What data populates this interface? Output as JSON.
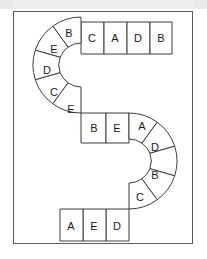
{
  "board": {
    "shape": "s-shaped-path",
    "frame_color": "#5a5a5a",
    "cell_fill": "#ffffff",
    "cell_stroke": "#3c3c3c",
    "label_color": "#1a1a1a",
    "top_band_color": "#e8e8e8",
    "total_cells": 18,
    "cells": [
      {
        "id": 1,
        "label": "B",
        "segment": "upper-arc",
        "cx": 68,
        "cy": 37
      },
      {
        "id": 2,
        "label": "C",
        "segment": "top-row",
        "cx": 92,
        "cy": 32
      },
      {
        "id": 3,
        "label": "A",
        "segment": "top-row",
        "cx": 115,
        "cy": 32
      },
      {
        "id": 4,
        "label": "D",
        "segment": "top-row",
        "cx": 138,
        "cy": 32
      },
      {
        "id": 5,
        "label": "B",
        "segment": "top-row",
        "cx": 160,
        "cy": 32
      },
      {
        "id": 6,
        "label": "E",
        "segment": "upper-arc",
        "cx": 53,
        "cy": 53
      },
      {
        "id": 7,
        "label": "D",
        "segment": "upper-arc",
        "cx": 46,
        "cy": 75
      },
      {
        "id": 8,
        "label": "C",
        "segment": "upper-arc",
        "cx": 52,
        "cy": 98
      },
      {
        "id": 9,
        "label": "E",
        "segment": "upper-arc",
        "cx": 70,
        "cy": 116
      },
      {
        "id": 10,
        "label": "B",
        "segment": "middle-row",
        "cx": 93,
        "cy": 120
      },
      {
        "id": 11,
        "label": "E",
        "segment": "middle-row",
        "cx": 116,
        "cy": 120
      },
      {
        "id": 12,
        "label": "A",
        "segment": "lower-arc",
        "cx": 141,
        "cy": 127
      },
      {
        "id": 13,
        "label": "D",
        "segment": "lower-arc",
        "cx": 153,
        "cy": 149
      },
      {
        "id": 14,
        "label": "B",
        "segment": "lower-arc",
        "cx": 153,
        "cy": 175
      },
      {
        "id": 15,
        "label": "C",
        "segment": "lower-arc",
        "cx": 138,
        "cy": 197
      },
      {
        "id": 16,
        "label": "D",
        "segment": "bottom-row",
        "cx": 113,
        "cy": 207
      },
      {
        "id": 17,
        "label": "E",
        "segment": "bottom-row",
        "cx": 90,
        "cy": 207
      },
      {
        "id": 18,
        "label": "A",
        "segment": "bottom-row",
        "cx": 66,
        "cy": 207
      }
    ]
  }
}
